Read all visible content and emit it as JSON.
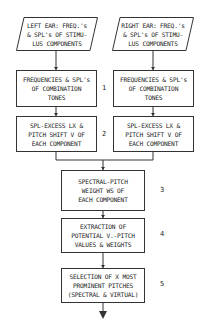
{
  "inputs": {
    "left": [
      "LEFT EAR: FREQ.'s",
      "& SPL's OF STIMU-",
      "LUS COMPONENTS"
    ],
    "right": [
      "RIGHT EAR: FREQ.'s",
      "& SPL's OF STIMU-",
      "LUS COMPONENTS"
    ]
  },
  "step1": {
    "number": "1",
    "left": [
      "FREQUENCIES & SPL's",
      "OF COMBINATION",
      "TONES"
    ],
    "right": [
      "FREQUENCIES & SPL's",
      "OF COMBINATION",
      "TONES"
    ]
  },
  "step2": {
    "number": "2",
    "left": [
      "SPL-EXCESS LX &",
      "PITCH SHIFT V OF",
      "EACH COMPONENT"
    ],
    "right": [
      "SPL-EXCESS LX &",
      "PITCH SHIFT V OF",
      "EACH COMPONENT"
    ]
  },
  "step3": {
    "number": "3",
    "lines": [
      "SPECTRAL-PITCH",
      "WEIGHT WS OF",
      "EACH COMPONENT"
    ]
  },
  "step4": {
    "number": "4",
    "lines": [
      "EXTRACTION OF",
      "POTENTIAL V.-PITCH",
      "VALUES & WEIGHTS"
    ]
  },
  "step5": {
    "number": "5",
    "lines": [
      "SELECTION OF X MOST",
      "PROMINENT PITCHES",
      "(SPECTRAL & VIRTUAL)"
    ]
  },
  "colors": {
    "line": "#333333",
    "background": "#ffffff"
  }
}
